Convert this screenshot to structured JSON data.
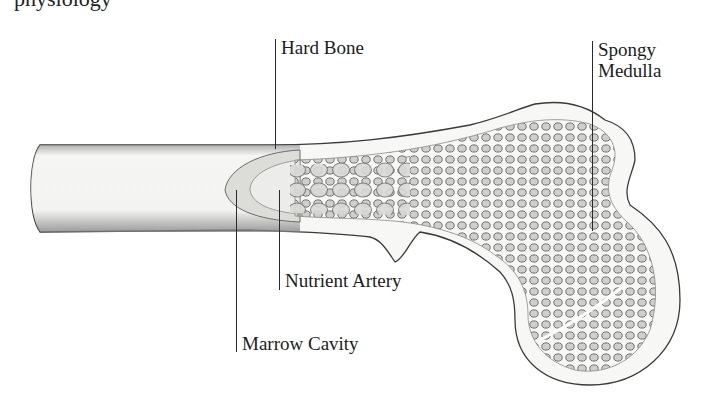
{
  "figure": {
    "top_text_fragment": "physiology",
    "labels": {
      "hard_bone": "Hard Bone",
      "spongy_line1": "Spongy",
      "spongy_line2": "Medulla",
      "nutrient_artery": "Nutrient Artery",
      "marrow_cavity": "Marrow Cavity"
    },
    "colors": {
      "ink": "#1c1c1c",
      "bone_fill": "#f7f7f5",
      "shading": "#8a8a8a",
      "background": "#ffffff"
    }
  }
}
